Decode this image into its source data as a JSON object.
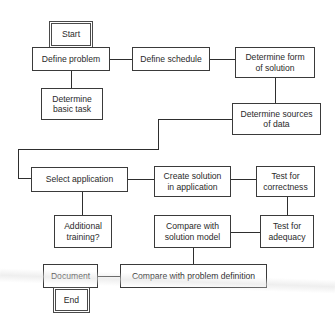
{
  "diagram": {
    "type": "flowchart",
    "nodes": [
      {
        "id": "start",
        "label": "Start",
        "kind": "terminal"
      },
      {
        "id": "define_problem",
        "label": "Define problem",
        "kind": "process"
      },
      {
        "id": "define_schedule",
        "label": "Define schedule",
        "kind": "process"
      },
      {
        "id": "determine_form",
        "label": "Determine form of solution",
        "kind": "process"
      },
      {
        "id": "determine_basic_task",
        "label": "Determine basic task",
        "kind": "process"
      },
      {
        "id": "determine_sources",
        "label": "Determine sources of data",
        "kind": "process"
      },
      {
        "id": "select_application",
        "label": "Select application",
        "kind": "process"
      },
      {
        "id": "create_solution",
        "label": "Create solution in application",
        "kind": "process"
      },
      {
        "id": "test_correctness",
        "label": "Test for correctness",
        "kind": "process"
      },
      {
        "id": "additional_training",
        "label": "Additional training?",
        "kind": "process"
      },
      {
        "id": "compare_solution_model",
        "label": "Compare with solution model",
        "kind": "process"
      },
      {
        "id": "test_adequacy",
        "label": "Test for adequacy",
        "kind": "process"
      },
      {
        "id": "document",
        "label": "Document",
        "kind": "process"
      },
      {
        "id": "compare_problem_definition",
        "label": "Compare with problem definition",
        "kind": "process"
      },
      {
        "id": "end",
        "label": "End",
        "kind": "terminal"
      }
    ],
    "edges": [
      {
        "from": "start",
        "to": "define_problem"
      },
      {
        "from": "define_problem",
        "to": "define_schedule"
      },
      {
        "from": "define_problem",
        "to": "determine_basic_task"
      },
      {
        "from": "define_schedule",
        "to": "determine_form"
      },
      {
        "from": "determine_form",
        "to": "determine_sources"
      },
      {
        "from": "determine_sources",
        "to": "select_application"
      },
      {
        "from": "select_application",
        "to": "create_solution"
      },
      {
        "from": "select_application",
        "to": "additional_training"
      },
      {
        "from": "create_solution",
        "to": "test_correctness"
      },
      {
        "from": "test_correctness",
        "to": "test_adequacy"
      },
      {
        "from": "test_adequacy",
        "to": "compare_solution_model"
      },
      {
        "from": "compare_solution_model",
        "to": "compare_problem_definition"
      },
      {
        "from": "compare_problem_definition",
        "to": "document"
      },
      {
        "from": "document",
        "to": "end"
      }
    ]
  },
  "labels": {
    "start": "Start",
    "define_problem": "Define problem",
    "define_schedule": "Define schedule",
    "determine_form": "Determine form of solution",
    "determine_basic_task": "Determine basic task",
    "determine_sources": "Determine sources of data",
    "select_application": "Select application",
    "create_solution": "Create solution in application",
    "test_correctness": "Test for correctness",
    "additional_training": "Additional training?",
    "compare_solution_model": "Compare with solution model",
    "test_adequacy": "Test for adequacy",
    "document": "Document",
    "compare_problem_definition": "Compare with problem definition",
    "end": "End"
  },
  "colors": {
    "line": "#2e2e2e",
    "box_border": "#3a3a3a",
    "background": "#ffffff",
    "text": "#2a2a2a"
  }
}
